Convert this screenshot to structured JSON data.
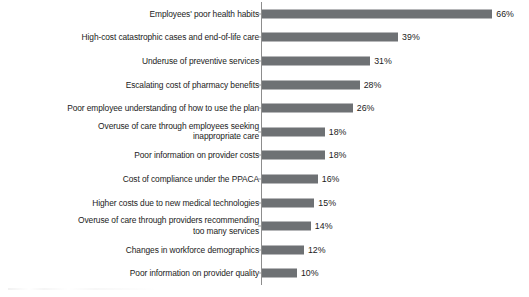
{
  "chart_data": {
    "type": "bar",
    "orientation": "horizontal",
    "title": "",
    "subtitle": "",
    "xlabel": "",
    "ylabel": "",
    "xlim": [
      0,
      66
    ],
    "grid": false,
    "legend": null,
    "value_suffix": "%",
    "bar_color": "#6e7174",
    "axis_color": "#8d8d8d",
    "text_color": "#1b1b1b",
    "background": "#ffffff",
    "categories": [
      "Employees' poor health habits",
      "High-cost catastrophic cases and end-of-life care",
      "Underuse of preventive services",
      "Escalating cost of pharmacy benefits",
      "Poor employee understanding of how to use the plan",
      "Overuse of care through employees seeking\ninappropriate care",
      "Poor information on provider costs",
      "Cost of compliance under the PPACA",
      "Higher costs due to new medical technologies",
      "Overuse of care through providers recommending\ntoo many services",
      "Changes in workforce demographics",
      "Poor information on provider quality"
    ],
    "values": [
      66,
      39,
      31,
      28,
      26,
      18,
      18,
      16,
      15,
      14,
      12,
      10
    ],
    "value_labels": [
      "66%",
      "39%",
      "31%",
      "28%",
      "26%",
      "18%",
      "18%",
      "16%",
      "15%",
      "14%",
      "12%",
      "10%"
    ]
  }
}
